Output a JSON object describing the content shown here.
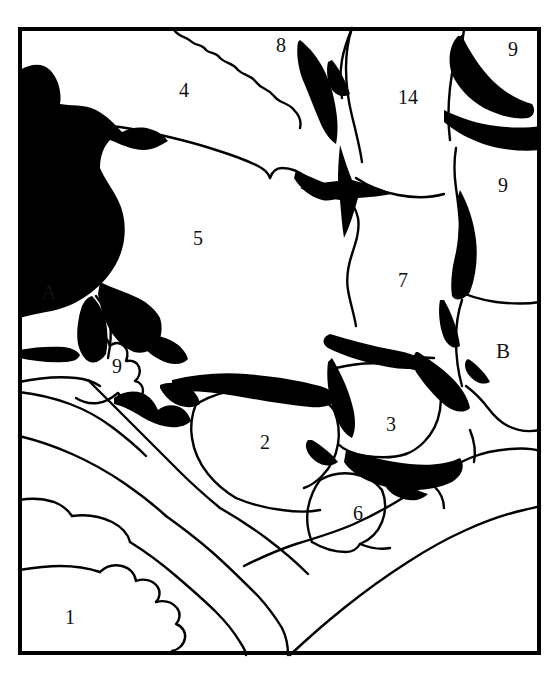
{
  "figure": {
    "name": "grain-microstructure-schematic",
    "type": "line-drawing",
    "background_color": "#ffffff",
    "ink_color": "#000000",
    "frame": {
      "x": 18,
      "y": 27,
      "width": 523,
      "height": 628,
      "border_width": 4,
      "color": "#000000"
    }
  },
  "labels": [
    {
      "id": "grain-8",
      "text": "8",
      "x": 281,
      "y": 45
    },
    {
      "id": "grain-9a",
      "text": "9",
      "x": 513,
      "y": 49
    },
    {
      "id": "grain-4",
      "text": "4",
      "x": 184,
      "y": 90
    },
    {
      "id": "grain-14",
      "text": "14",
      "x": 408,
      "y": 97
    },
    {
      "id": "grain-9b",
      "text": "9",
      "x": 503,
      "y": 185
    },
    {
      "id": "grain-5",
      "text": "5",
      "x": 198,
      "y": 238
    },
    {
      "id": "grain-7",
      "text": "7",
      "x": 403,
      "y": 280
    },
    {
      "id": "pore-A",
      "text": "A",
      "x": 49,
      "y": 292
    },
    {
      "id": "pore-B",
      "text": "B",
      "x": 503,
      "y": 351
    },
    {
      "id": "grain-9c",
      "text": "9",
      "x": 117,
      "y": 366
    },
    {
      "id": "grain-3",
      "text": "3",
      "x": 391,
      "y": 424
    },
    {
      "id": "grain-2",
      "text": "2",
      "x": 265,
      "y": 442
    },
    {
      "id": "grain-6",
      "text": "6",
      "x": 358,
      "y": 513
    },
    {
      "id": "grain-1",
      "text": "1",
      "x": 70,
      "y": 617
    }
  ]
}
